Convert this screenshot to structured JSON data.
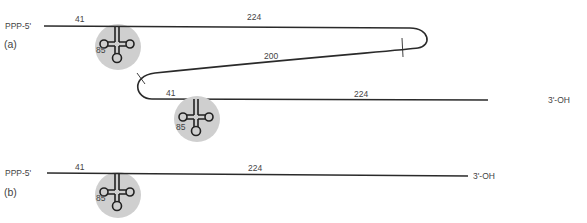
{
  "diagram": {
    "panel_a": {
      "label": "(a)",
      "five_prime_label": "PPP-5'",
      "three_prime_label": "3'-OH",
      "segment_top_left": "41",
      "segment_top_right": "224",
      "segment_middle": "200",
      "segment_bottom_left": "41",
      "segment_bottom_right": "224",
      "trna_1_label": "85",
      "trna_2_label": "85"
    },
    "panel_b": {
      "label": "(b)",
      "five_prime_label": "PPP-5'",
      "three_prime_label": "3'-OH",
      "segment_left": "41",
      "segment_right": "224",
      "trna_label": "85"
    },
    "colors": {
      "strand": "#2a2a2a",
      "trna_background": "#cfcfcf",
      "text": "#444444"
    }
  }
}
